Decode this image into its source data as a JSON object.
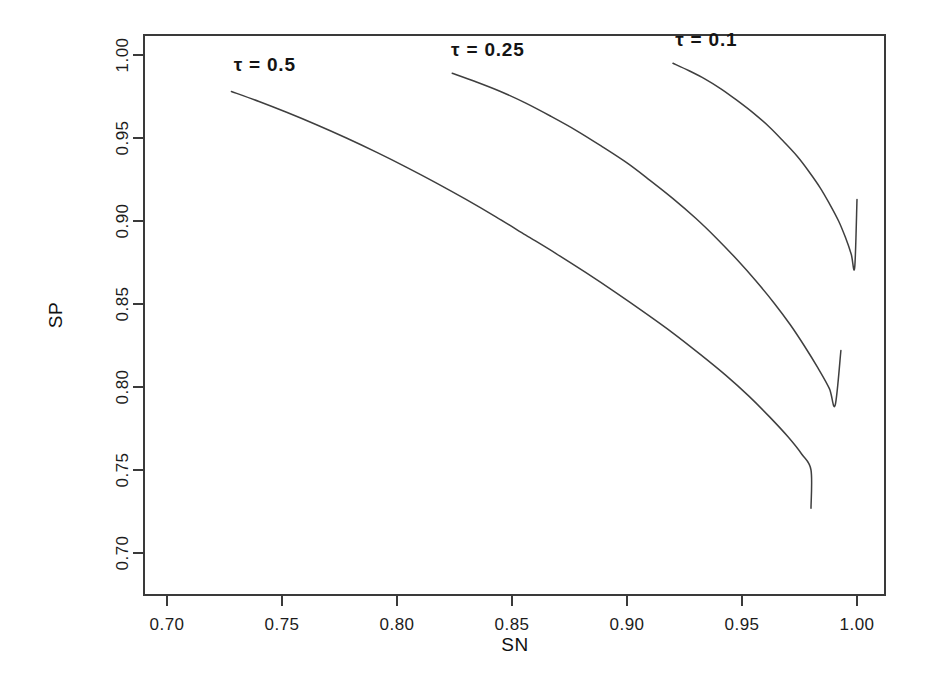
{
  "chart_data": {
    "type": "line",
    "title": "",
    "xlabel": "SN",
    "ylabel": "SP",
    "xlim": [
      0.682,
      0.712
    ],
    "ylim": [
      0.688,
      1.012
    ],
    "x_axis_range": [
      0.7,
      1.0
    ],
    "y_axis_range": [
      0.7,
      1.0
    ],
    "xticks": [
      0.7,
      0.75,
      0.8,
      0.85,
      0.9,
      0.95,
      1.0
    ],
    "xtick_labels": [
      "0.70",
      "0.75",
      "0.80",
      "0.85",
      "0.90",
      "0.95",
      "1.00"
    ],
    "yticks": [
      0.7,
      0.75,
      0.8,
      0.85,
      0.9,
      0.95,
      1.0
    ],
    "ytick_labels": [
      "0.70",
      "0.75",
      "0.80",
      "0.85",
      "0.90",
      "0.95",
      "1.00"
    ],
    "grid": false,
    "legend": "inline-annotations",
    "series": [
      {
        "name": "tau-0.5",
        "label": "τ = 0.5",
        "tau": 0.5,
        "label_x": 0.7425,
        "label_y": 0.9905,
        "points": [
          [
            0.728,
            0.978
          ],
          [
            0.74,
            0.972
          ],
          [
            0.752,
            0.9655
          ],
          [
            0.765,
            0.958
          ],
          [
            0.778,
            0.95
          ],
          [
            0.791,
            0.9415
          ],
          [
            0.804,
            0.9325
          ],
          [
            0.817,
            0.923
          ],
          [
            0.83,
            0.913
          ],
          [
            0.843,
            0.9025
          ],
          [
            0.856,
            0.8915
          ],
          [
            0.869,
            0.8805
          ],
          [
            0.882,
            0.869
          ],
          [
            0.895,
            0.857
          ],
          [
            0.908,
            0.8445
          ],
          [
            0.92,
            0.8325
          ],
          [
            0.932,
            0.8195
          ],
          [
            0.943,
            0.807
          ],
          [
            0.953,
            0.7945
          ],
          [
            0.962,
            0.782
          ],
          [
            0.97,
            0.77
          ],
          [
            0.976,
            0.7595
          ],
          [
            0.98,
            0.75
          ]
        ],
        "endpoints": {
          "start": [
            0.728,
            0.978
          ],
          "end": [
            0.98,
            0.727
          ]
        }
      },
      {
        "name": "tau-0.25",
        "label": "τ = 0.25",
        "tau": 0.25,
        "label_x": 0.8395,
        "label_y": 0.9995,
        "points": [
          [
            0.824,
            0.989
          ],
          [
            0.834,
            0.984
          ],
          [
            0.845,
            0.978
          ],
          [
            0.856,
            0.971
          ],
          [
            0.867,
            0.963
          ],
          [
            0.878,
            0.9545
          ],
          [
            0.889,
            0.945
          ],
          [
            0.9,
            0.935
          ],
          [
            0.91,
            0.9245
          ],
          [
            0.92,
            0.9135
          ],
          [
            0.93,
            0.9015
          ],
          [
            0.939,
            0.8895
          ],
          [
            0.948,
            0.8765
          ],
          [
            0.956,
            0.864
          ],
          [
            0.964,
            0.8505
          ],
          [
            0.971,
            0.8375
          ],
          [
            0.977,
            0.825
          ],
          [
            0.983,
            0.8115
          ],
          [
            0.988,
            0.799
          ],
          [
            0.9905,
            0.789
          ]
        ],
        "endpoints": {
          "start": [
            0.824,
            0.989
          ],
          "end": [
            0.993,
            0.822
          ]
        }
      },
      {
        "name": "tau-0.1",
        "label": "τ = 0.1",
        "tau": 0.1,
        "label_x": 0.9345,
        "label_y": 1.0055,
        "points": [
          [
            0.92,
            0.995
          ],
          [
            0.927,
            0.9905
          ],
          [
            0.934,
            0.9855
          ],
          [
            0.941,
            0.9795
          ],
          [
            0.948,
            0.9725
          ],
          [
            0.955,
            0.965
          ],
          [
            0.962,
            0.9565
          ],
          [
            0.968,
            0.948
          ],
          [
            0.974,
            0.939
          ],
          [
            0.979,
            0.93
          ],
          [
            0.984,
            0.92
          ],
          [
            0.988,
            0.9105
          ],
          [
            0.992,
            0.9
          ],
          [
            0.995,
            0.89
          ],
          [
            0.9975,
            0.88
          ],
          [
            0.999,
            0.872
          ]
        ],
        "endpoints": {
          "start": [
            0.92,
            0.995
          ],
          "end": [
            1.0,
            0.913
          ]
        }
      }
    ]
  },
  "figure": {
    "xlabel": "SN",
    "ylabel": "SP",
    "background_color": "#ffffff",
    "line_color": "#3f3f3f",
    "text_color": "#141414"
  }
}
